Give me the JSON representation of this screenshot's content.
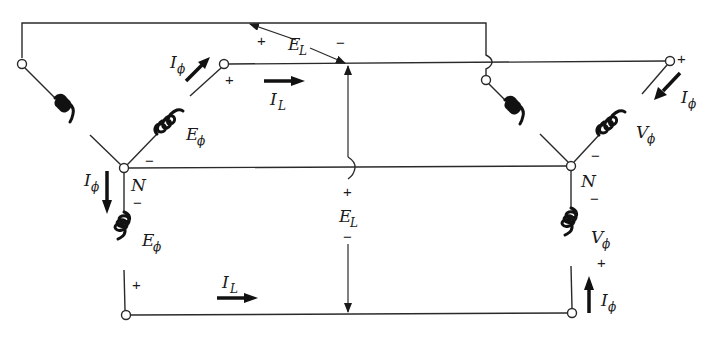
{
  "diagram": {
    "type": "Y-Y three-phase circuit (generator to load)",
    "colors": {
      "background": "#ffffff",
      "ink": "#1a1a1a"
    },
    "labels": {
      "line_voltage_top": {
        "main": "E",
        "sub": "L",
        "plus": "+",
        "minus": "−"
      },
      "line_voltage_mid": {
        "main": "E",
        "sub": "L",
        "plus": "+",
        "minus": "−"
      },
      "line_current_top": {
        "main": "I",
        "sub": "L"
      },
      "line_current_bottom": {
        "main": "I",
        "sub": "L"
      },
      "gen_phase_current_upper": {
        "main": "I",
        "sub": "ϕ"
      },
      "gen_phase_current_left": {
        "main": "I",
        "sub": "ϕ"
      },
      "gen_phase_voltage_upper": {
        "main": "E",
        "sub": "ϕ",
        "plus": "+",
        "minus": "−"
      },
      "gen_phase_voltage_lower": {
        "main": "E",
        "sub": "ϕ",
        "plus": "+",
        "minus": "−"
      },
      "gen_neutral": "N",
      "load_neutral": "N",
      "load_phase_voltage_upper": {
        "main": "V",
        "sub": "ϕ",
        "plus": "+",
        "minus": "−"
      },
      "load_phase_voltage_lower": {
        "main": "V",
        "sub": "ϕ",
        "plus": "+",
        "minus": "−"
      },
      "load_phase_current_upper": {
        "main": "I",
        "sub": "ϕ"
      },
      "load_phase_current_lower": {
        "main": "I",
        "sub": "ϕ"
      }
    }
  }
}
